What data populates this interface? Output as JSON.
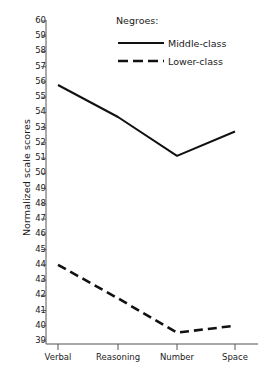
{
  "chart_data": {
    "type": "line",
    "title": "",
    "xlabel": "",
    "ylabel": "Normalized scale scores",
    "categories": [
      "Verbal",
      "Reasoning",
      "Number",
      "Space"
    ],
    "ylim": [
      39,
      60
    ],
    "yticks": [
      60,
      59,
      58,
      57,
      56,
      55,
      54,
      53,
      52,
      51,
      50,
      49,
      48,
      47,
      46,
      45,
      44,
      43,
      42,
      41,
      40,
      39
    ],
    "grid": false,
    "legend_position": "top-right",
    "legend_title": "Negroes:",
    "series": [
      {
        "name": "Middle-class",
        "style": "solid",
        "color": "#111111",
        "values": [
          55.8,
          53.7,
          51.15,
          52.75
        ]
      },
      {
        "name": "Lower-class",
        "style": "dashed",
        "color": "#111111",
        "values": [
          44.0,
          41.8,
          39.55,
          40.0
        ]
      }
    ]
  },
  "axes": {
    "y_title": "Normalized scale scores"
  },
  "legend": {
    "title": "Negroes:",
    "entries": [
      {
        "label": "Middle-class",
        "style": "solid"
      },
      {
        "label": "Lower-class",
        "style": "dashed"
      }
    ]
  }
}
